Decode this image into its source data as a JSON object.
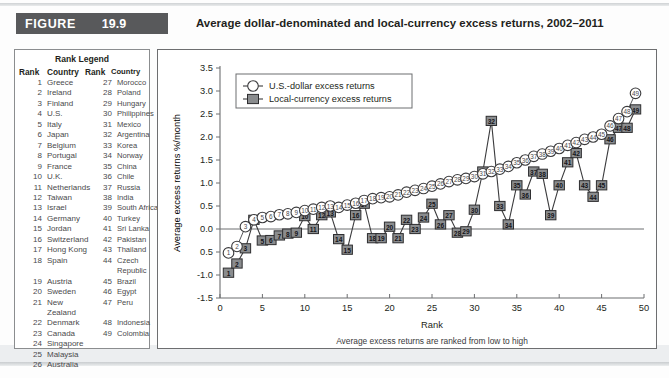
{
  "figure": {
    "tag_word": "FIGURE",
    "number": "19.9",
    "title": "Average dollar-denominated and local-currency excess returns, 2002–2011"
  },
  "rank_legend": {
    "title": "Rank Legend",
    "headers": [
      "Rank",
      "Country",
      "Rank",
      "Country"
    ],
    "rows": [
      [
        "1",
        "Greece",
        "27",
        "Morocco"
      ],
      [
        "2",
        "Ireland",
        "28",
        "Poland"
      ],
      [
        "3",
        "Finland",
        "29",
        "Hungary"
      ],
      [
        "4",
        "U.S.",
        "30",
        "Philippines"
      ],
      [
        "5",
        "Italy",
        "31",
        "Mexico"
      ],
      [
        "6",
        "Japan",
        "32",
        "Argentina"
      ],
      [
        "7",
        "Belgium",
        "33",
        "Korea"
      ],
      [
        "8",
        "Portugal",
        "34",
        "Norway"
      ],
      [
        "9",
        "France",
        "35",
        "China"
      ],
      [
        "10",
        "U.K.",
        "36",
        "Chile"
      ],
      [
        "11",
        "Netherlands",
        "37",
        "Russia"
      ],
      [
        "12",
        "Taiwan",
        "38",
        "India"
      ],
      [
        "13",
        "Israel",
        "39",
        "South Africa"
      ],
      [
        "14",
        "Germany",
        "40",
        "Turkey"
      ],
      [
        "15",
        "Jordan",
        "41",
        "Sri Lanka"
      ],
      [
        "16",
        "Switzerland",
        "42",
        "Pakistan"
      ],
      [
        "17",
        "Hong Kong",
        "43",
        "Thailand"
      ],
      [
        "18",
        "Spain",
        "44",
        "Czech Republic"
      ],
      [
        "19",
        "Austria",
        "45",
        "Brazil"
      ],
      [
        "20",
        "Sweden",
        "46",
        "Egypt"
      ],
      [
        "21",
        "New Zealand",
        "47",
        "Peru"
      ],
      [
        "22",
        "Denmark",
        "48",
        "Indonesia"
      ],
      [
        "23",
        "Canada",
        "49",
        "Colombia"
      ],
      [
        "24",
        "Singapore",
        "",
        ""
      ],
      [
        "25",
        "Malaysia",
        "",
        ""
      ],
      [
        "26",
        "Australia",
        "",
        ""
      ]
    ]
  },
  "chart_data": {
    "type": "line",
    "title": "Average dollar-denominated and local-currency excess returns, 2002–2011",
    "xlabel": "Rank",
    "ylabel": "Average excess returns %/month",
    "caption": "Average excess returns are ranked from low to high",
    "xlim": [
      0,
      50
    ],
    "ylim": [
      -1.5,
      3.5
    ],
    "xticks": [
      "0",
      "5",
      "10",
      "15",
      "20",
      "25",
      "30",
      "35",
      "40",
      "45",
      "50"
    ],
    "yticks": [
      "3.5",
      "3.0",
      "2.5",
      "2.0",
      "1.5",
      "1.0",
      "0.5",
      "0.0",
      "0.5",
      "-1.0",
      "-1.5"
    ],
    "grid": false,
    "legend_position": "top-left",
    "zero_line": 0,
    "x": [
      1,
      2,
      3,
      4,
      5,
      6,
      7,
      8,
      9,
      10,
      11,
      12,
      13,
      14,
      15,
      16,
      17,
      18,
      19,
      20,
      21,
      22,
      23,
      24,
      25,
      26,
      27,
      28,
      29,
      30,
      31,
      32,
      33,
      34,
      35,
      36,
      37,
      38,
      39,
      40,
      41,
      42,
      43,
      44,
      45,
      46,
      47,
      48,
      49
    ],
    "series": [
      {
        "name": "U.S.-dollar excess returns",
        "marker": "open-circle",
        "values": [
          -0.52,
          -0.38,
          0.05,
          0.2,
          0.25,
          0.27,
          0.31,
          0.33,
          0.36,
          0.4,
          0.43,
          0.47,
          0.5,
          0.47,
          0.52,
          0.56,
          0.62,
          0.66,
          0.68,
          0.7,
          0.74,
          0.8,
          0.84,
          0.88,
          0.93,
          0.98,
          1.03,
          1.07,
          1.1,
          1.14,
          1.2,
          1.25,
          1.3,
          1.36,
          1.44,
          1.5,
          1.58,
          1.63,
          1.69,
          1.75,
          1.82,
          1.88,
          1.95,
          2.0,
          2.06,
          2.24,
          2.4,
          2.55,
          2.95
        ]
      },
      {
        "name": "Local-currency excess returns",
        "marker": "filled-square",
        "values": [
          -0.95,
          -0.75,
          -0.42,
          0.2,
          -0.25,
          -0.24,
          -0.14,
          -0.1,
          -0.08,
          0.28,
          0.0,
          0.3,
          0.36,
          -0.22,
          -0.45,
          0.3,
          0.55,
          -0.2,
          -0.2,
          0.05,
          -0.2,
          0.2,
          0.0,
          0.25,
          0.55,
          0.1,
          0.3,
          -0.08,
          -0.05,
          0.42,
          1.25,
          2.35,
          0.5,
          0.1,
          0.95,
          0.75,
          1.25,
          1.2,
          0.3,
          0.95,
          1.45,
          1.65,
          0.95,
          0.7,
          0.95,
          1.95,
          2.2,
          2.2,
          2.6
        ]
      }
    ]
  },
  "chart_legend": {
    "items": [
      {
        "label": "U.S.-dollar excess returns",
        "marker": "open-circle"
      },
      {
        "label": "Local-currency excess returns",
        "marker": "filled-square"
      }
    ]
  }
}
